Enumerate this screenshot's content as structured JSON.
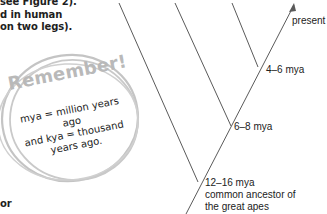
{
  "body_text": {
    "lines": [
      "see Figure 2).",
      "d in human",
      "on two legs)."
    ],
    "trailing_fragment": "or"
  },
  "callout": {
    "title": "Remember!",
    "lines": [
      "mya = million years ago",
      "and kya = thousand",
      "years ago."
    ],
    "ring_color": "#c4c4c4",
    "title_color": "#b9b9b9"
  },
  "diagram": {
    "type": "evolutionary-tree",
    "line_color": "#5a5a5a",
    "labels": {
      "present": "present",
      "node_1": "4–6 mya",
      "node_2": "6–8 mya",
      "node_3": "12–16 mya",
      "node_3_desc_1": "common ancestor of",
      "node_3_desc_2": "the great apes"
    }
  }
}
